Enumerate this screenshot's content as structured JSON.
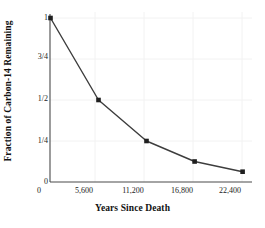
{
  "chart_data": {
    "type": "line",
    "title": "",
    "xlabel": "Years Since Death",
    "ylabel": "Fraction of Carbon-14 Remaining",
    "x": [
      0,
      5600,
      11200,
      16800,
      22400
    ],
    "values": [
      1,
      0.5,
      0.25,
      0.125,
      0.0625
    ],
    "series": [
      {
        "name": "Fraction of Carbon-14 Remaining",
        "values": [
          1,
          0.5,
          0.25,
          0.125,
          0.0625
        ]
      }
    ],
    "xtick_labels": [
      "0",
      "5,600",
      "11,200",
      "16,800",
      "22,400"
    ],
    "xtick_values": [
      0,
      5600,
      11200,
      16800,
      22400
    ],
    "ytick_labels": [
      "0",
      "1/4",
      "1/2",
      "3/4",
      "1"
    ],
    "ytick_values": [
      0,
      0.25,
      0.5,
      0.75,
      1
    ],
    "xlim": [
      0,
      23500
    ],
    "ylim": [
      0,
      1
    ],
    "grid": true,
    "legend": false,
    "marker": "square",
    "line_color": "#3d3d3d",
    "marker_color": "#1f1f1f",
    "grid_color": "#f2f2f2",
    "axis_color": "#4a4a4a",
    "background_color": "#ffffff"
  },
  "axes": {
    "x_title": "Years Since Death",
    "y_title": "Fraction of Carbon-14 Remaining"
  },
  "ticks": {
    "y": [
      {
        "label": "1",
        "top": 13
      },
      {
        "label": "3/4",
        "top": 52
      },
      {
        "label": "1/2",
        "top": 94
      },
      {
        "label": "1/4",
        "top": 136
      },
      {
        "label": "0",
        "top": 177
      }
    ],
    "x": [
      {
        "label": "0",
        "left": 17
      },
      {
        "label": "5,600",
        "left": 62
      },
      {
        "label": "11,200",
        "left": 111
      },
      {
        "label": "16,800",
        "left": 160
      },
      {
        "label": "22,400",
        "left": 208
      }
    ]
  }
}
